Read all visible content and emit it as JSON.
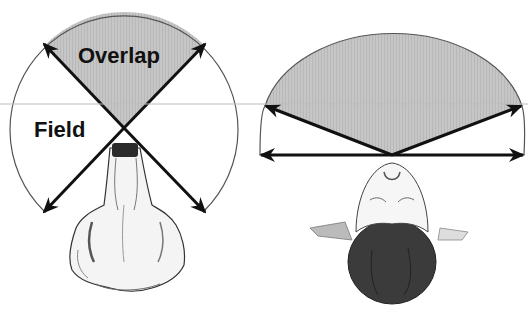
{
  "labels": {
    "overlap": "Overlap",
    "field": "Field"
  },
  "colors": {
    "overlap_fill": "#c4c4c4",
    "arrow": "#111111",
    "arc": "#555555",
    "guide_line": "#bdbdbd",
    "background": "#ffffff"
  },
  "panels": [
    {
      "name": "left-animal-top-view",
      "description": "Wide visual field with small binocular overlap (animal, top view)"
    },
    {
      "name": "right-human-top-view",
      "description": "Narrow visual field with large binocular overlap (human, top view)"
    }
  ]
}
